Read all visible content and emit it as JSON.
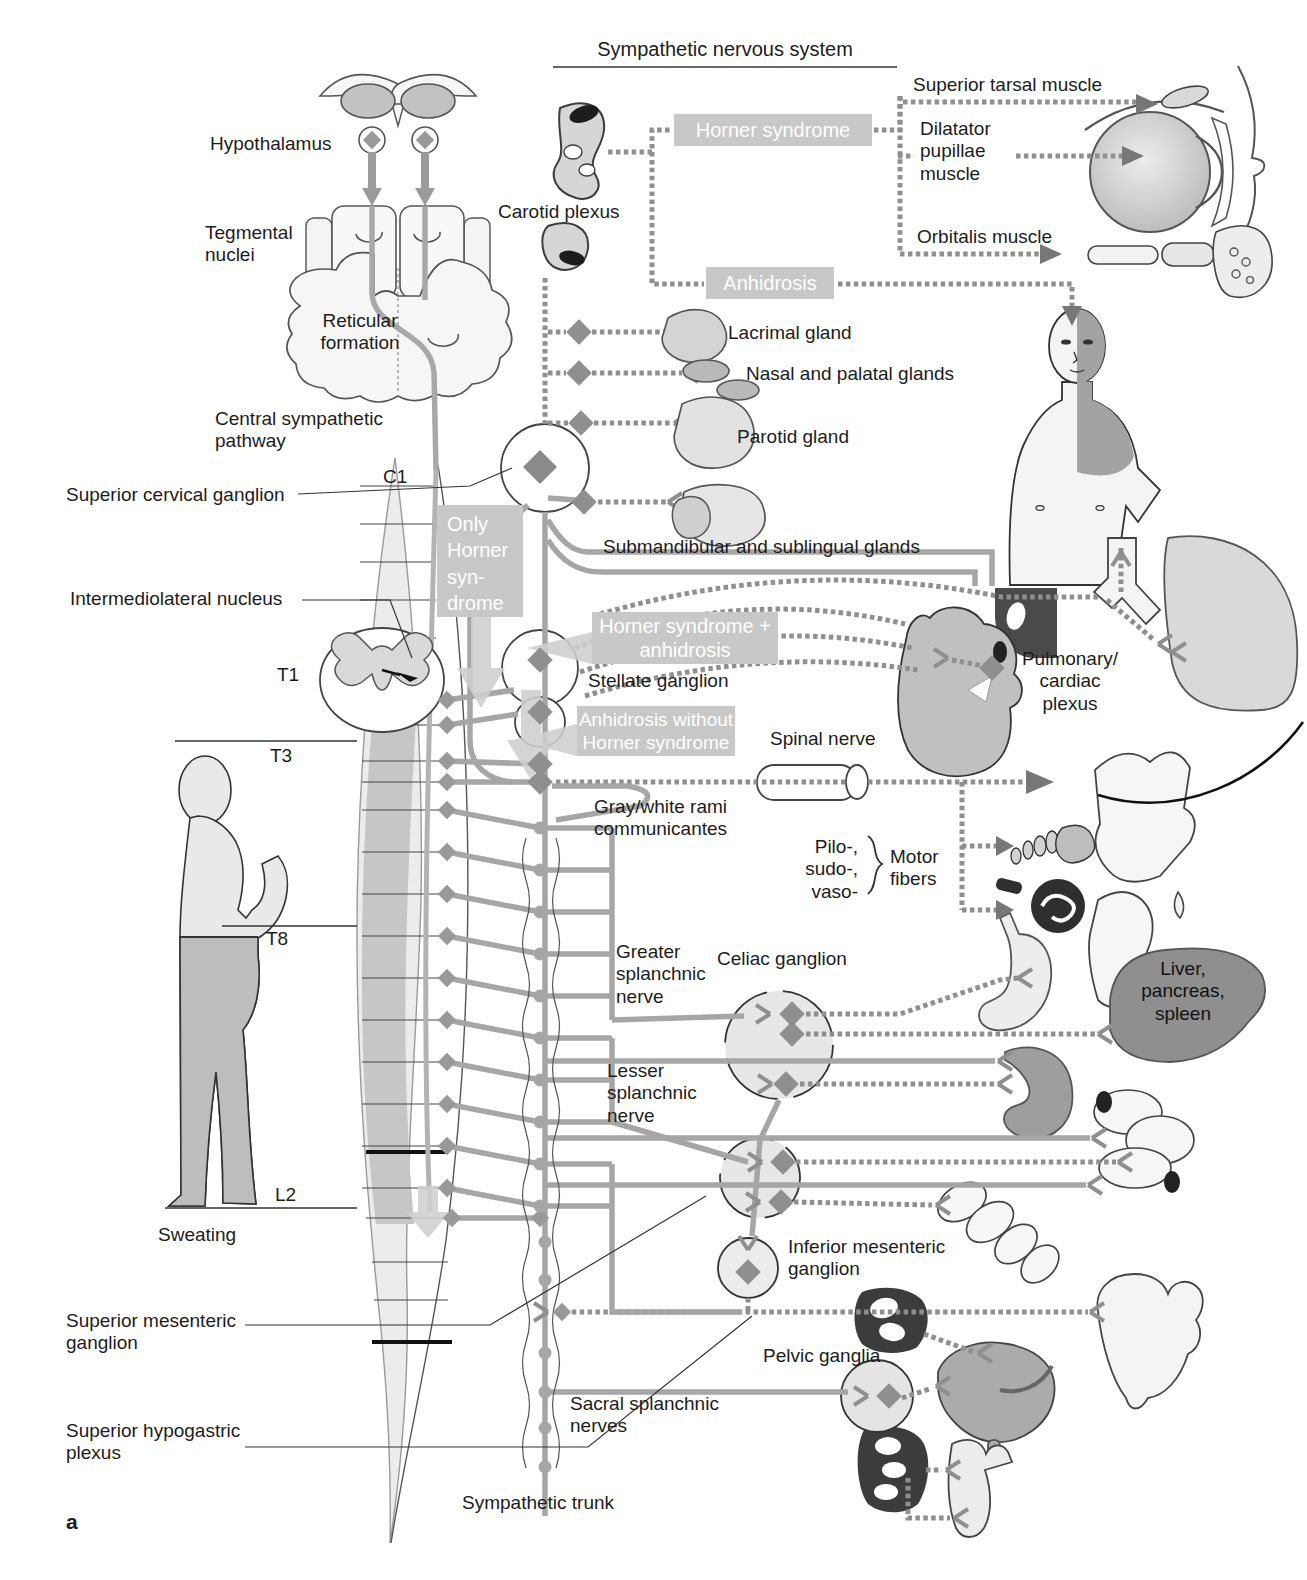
{
  "title": "Sympathetic nervous system",
  "panel_label": "a",
  "colors": {
    "box_bg": "#c8c8c8",
    "box_text": "#ffffff",
    "nerve_solid": "#a6a6a6",
    "nerve_beaded": "#8f8f8f",
    "cord_shade_dark": "#c6c6c6",
    "cord_shade_light": "#ececec",
    "organ_dark": "#8f8f8f"
  },
  "labels": {
    "hypothalamus": "Hypothalamus",
    "tegmental_nuclei": "Tegmental\nnuclei",
    "reticular_formation": "Reticular\nformation",
    "central_sympathetic_pathway": "Central sympathetic\npathway",
    "superior_cervical_ganglion": "Superior cervical ganglion",
    "intermediolateral_nucleus": "Intermediolateral nucleus",
    "carotid_plexus": "Carotid plexus",
    "superior_tarsal_muscle": "Superior tarsal muscle",
    "dilatator_pupillae_muscle": "Dilatator\npupillae\nmuscle",
    "orbitalis_muscle": "Orbitalis muscle",
    "lacrimal_gland": "Lacrimal gland",
    "nasal_palatal_glands": "Nasal and palatal glands",
    "parotid_gland": "Parotid gland",
    "submandibular_sublingual_glands": "Submandibular and sublingual glands",
    "stellate_ganglion": "Stellate ganglion",
    "spinal_nerve": "Spinal nerve",
    "gray_white_rami": "Gray/white rami\ncommunicantes",
    "pilo_sudo_vaso": "Pilo-,\nsudo-,\nvaso-",
    "motor_fibers": "Motor\nfibers",
    "pulmonary_cardiac_plexus": "Pulmonary/\ncardiac\nplexus",
    "greater_splanchnic_nerve": "Greater\nsplanchnic\nnerve",
    "celiac_ganglion": "Celiac ganglion",
    "lesser_splanchnic_nerve": "Lesser\nsplanchnic\nnerve",
    "liver_pancreas_spleen": "Liver,\npancreas,\nspleen",
    "inferior_mesenteric_ganglion": "Inferior mesenteric\nganglion",
    "pelvic_ganglia": "Pelvic ganglia",
    "sacral_splanchnic_nerves": "Sacral splanchnic\nnerves",
    "sympathetic_trunk": "Sympathetic trunk",
    "sweating": "Sweating",
    "superior_mesenteric_ganglion": "Superior mesenteric\nganglion",
    "superior_hypogastric_plexus": "Superior hypogastric\nplexus"
  },
  "spinal_levels": {
    "c1": "C1",
    "t1": "T1",
    "t3": "T3",
    "t8": "T8",
    "l2": "L2"
  },
  "syndrome_boxes": {
    "horner": "Horner syndrome",
    "anhidrosis": "Anhidrosis",
    "only_horner": "Only\nHorner\nsyn-\ndrome",
    "horner_plus_anhidrosis": "Horner syndrome +\nanhidrosis",
    "anhidrosis_without_horner": "Anhidrosis without\nHorner syndrome"
  }
}
